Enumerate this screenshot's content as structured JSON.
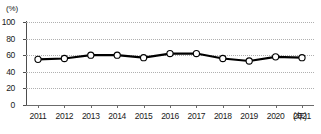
{
  "chart_data": {
    "type": "line",
    "title": "",
    "xlabel": "(年)",
    "ylabel": "(%)",
    "categories": [
      "2011",
      "2012",
      "2013",
      "2014",
      "2015",
      "2016",
      "2017",
      "2018",
      "2019",
      "2020",
      "2021"
    ],
    "values": [
      55,
      56,
      60,
      60,
      57,
      62,
      62,
      56,
      53,
      58,
      57
    ],
    "series": [
      {
        "name": "",
        "values": [
          55,
          56,
          60,
          60,
          57,
          62,
          62,
          56,
          53,
          58,
          57
        ]
      }
    ],
    "ylim": [
      0,
      100
    ],
    "yticks": [
      0,
      20,
      40,
      60,
      80,
      100
    ],
    "ytick_labels": [
      "0",
      "20",
      "40",
      "60",
      "80",
      "100"
    ],
    "grid": "horizontal-dotted",
    "legend": "none",
    "marker": "open-circle",
    "line_color": "#000000",
    "marker_fill": "#ffffff",
    "marker_stroke": "#000000",
    "grid_color": "#b0b0b0",
    "axis_color": "#4d4d4d"
  },
  "axes": {
    "y_unit_label": "(%)",
    "x_unit_label": "(年)"
  }
}
